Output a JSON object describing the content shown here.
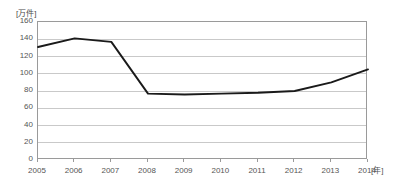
{
  "chart_data": {
    "type": "line",
    "title": "",
    "subtitle": "",
    "xlabel": "年",
    "ylabel": "万件",
    "unit_label": "[万件]",
    "xaxis_unit_label": "[年]",
    "categories": [
      "2005",
      "2006",
      "2007",
      "2008",
      "2009",
      "2010",
      "2011",
      "2012",
      "2013",
      "2014"
    ],
    "x": [
      2005,
      2006,
      2007,
      2008,
      2009,
      2010,
      2011,
      2012,
      2013,
      2014
    ],
    "values": [
      131,
      141,
      137,
      77,
      76,
      77,
      78,
      80,
      90,
      105
    ],
    "series": [
      {
        "name": "件数",
        "values": [
          131,
          141,
          137,
          77,
          76,
          77,
          78,
          80,
          90,
          105
        ]
      }
    ],
    "ylim": [
      0,
      160
    ],
    "ytick_step": 20,
    "yticks": [
      0,
      20,
      40,
      60,
      80,
      100,
      120,
      140,
      160
    ],
    "ytick_labels": [
      "0",
      "20",
      "40",
      "60",
      "80",
      "100",
      "120",
      "140",
      "160"
    ],
    "xlim": [
      2005,
      2014
    ],
    "grid": true,
    "grid_axis": "y",
    "legend": false,
    "legend_position": "none",
    "line_color": "#1a1a1a",
    "grid_color": "#c9c9c9",
    "frame_color": "#9a9a9a",
    "background_color": "#ffffff",
    "text_color": "#555555",
    "markers": false,
    "annotations": []
  }
}
